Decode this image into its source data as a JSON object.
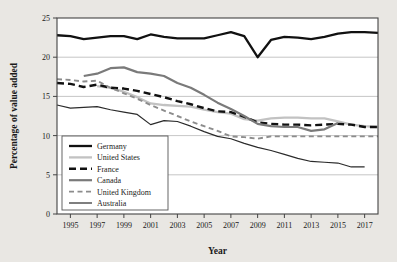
{
  "chart_data": {
    "type": "line",
    "title": "",
    "xlabel": "Year",
    "ylabel": "Percentage of value added",
    "xlim": [
      1994,
      2018
    ],
    "ylim": [
      0,
      25
    ],
    "grid": "horizontal",
    "legend_position": "lower-left-inside",
    "xticks": [
      1995,
      1997,
      1999,
      2001,
      2003,
      2005,
      2007,
      2009,
      2011,
      2013,
      2015,
      2017
    ],
    "xtick_labels": [
      "1995",
      "1997",
      "1999",
      "2001",
      "2003",
      "2005",
      "2007",
      "2009",
      "2011",
      "2013",
      "2015",
      "2017"
    ],
    "yticks": [
      0,
      5,
      10,
      15,
      20,
      25
    ],
    "ytick_labels": [
      "0",
      "5",
      "10",
      "15",
      "20",
      "25"
    ],
    "series": [
      {
        "name": "Germany",
        "color": "#111111",
        "width": 2.3,
        "dash": "none",
        "x": [
          1994,
          1995,
          1996,
          1997,
          1998,
          1999,
          2000,
          2001,
          2002,
          2003,
          2004,
          2005,
          2006,
          2007,
          2008,
          2009,
          2010,
          2011,
          2012,
          2013,
          2014,
          2015,
          2016,
          2017,
          2018
        ],
        "values": [
          22.8,
          22.7,
          22.3,
          22.5,
          22.7,
          22.7,
          22.3,
          22.9,
          22.6,
          22.4,
          22.4,
          22.4,
          22.8,
          23.2,
          22.7,
          20.0,
          22.2,
          22.6,
          22.5,
          22.3,
          22.6,
          23.0,
          23.2,
          23.2,
          23.1
        ]
      },
      {
        "name": "United States",
        "color": "#c2c2c2",
        "width": 2.3,
        "dash": "none",
        "x": [
          1997,
          1998,
          1999,
          2000,
          2001,
          2002,
          2003,
          2004,
          2005,
          2006,
          2007,
          2008,
          2009,
          2010,
          2011,
          2012,
          2013,
          2014,
          2015,
          2016,
          2017,
          2018
        ],
        "values": [
          16.3,
          16.1,
          15.6,
          14.9,
          14.1,
          13.9,
          13.8,
          13.7,
          13.3,
          13.0,
          12.8,
          12.1,
          11.9,
          12.2,
          12.3,
          12.3,
          12.2,
          12.2,
          11.8,
          11.4,
          11.2,
          11.1
        ]
      },
      {
        "name": "France",
        "color": "#111111",
        "width": 2.4,
        "dash": "7,4",
        "x": [
          1994,
          1995,
          1996,
          1997,
          1998,
          1999,
          2000,
          2001,
          2002,
          2003,
          2004,
          2005,
          2006,
          2007,
          2008,
          2009,
          2010,
          2011,
          2012,
          2013,
          2014,
          2015,
          2016,
          2017,
          2018
        ],
        "values": [
          16.7,
          16.6,
          16.2,
          16.5,
          16.1,
          16.0,
          15.7,
          15.3,
          14.9,
          14.4,
          14.0,
          13.5,
          13.1,
          13.0,
          12.4,
          11.7,
          11.5,
          11.4,
          11.4,
          11.3,
          11.4,
          11.5,
          11.4,
          11.1,
          11.1
        ]
      },
      {
        "name": "Canada",
        "color": "#7a7a7a",
        "width": 2.2,
        "dash": "none",
        "x": [
          1996,
          1997,
          1998,
          1999,
          2000,
          2001,
          2002,
          2003,
          2004,
          2005,
          2006,
          2007,
          2008,
          2009,
          2010,
          2011,
          2012,
          2013,
          2014,
          2015
        ],
        "values": [
          17.6,
          17.9,
          18.6,
          18.7,
          18.1,
          17.9,
          17.6,
          16.7,
          16.1,
          15.2,
          14.2,
          13.4,
          12.5,
          11.5,
          11.2,
          11.1,
          11.1,
          10.6,
          10.8,
          11.6
        ]
      },
      {
        "name": "United Kingdom",
        "color": "#8c8c8c",
        "width": 1.9,
        "dash": "5,3.5",
        "x": [
          1994,
          1995,
          1996,
          1997,
          1998,
          1999,
          2000,
          2001,
          2002,
          2003,
          2004,
          2005,
          2006,
          2007,
          2008,
          2009,
          2010,
          2011,
          2012,
          2013,
          2014,
          2015,
          2016,
          2017,
          2018
        ],
        "values": [
          17.2,
          17.1,
          16.9,
          17.0,
          16.1,
          15.4,
          14.7,
          13.9,
          13.2,
          12.5,
          11.8,
          11.2,
          10.6,
          9.9,
          9.8,
          9.6,
          9.9,
          9.9,
          9.9,
          9.9,
          9.9,
          9.9,
          9.9,
          9.9,
          9.9
        ]
      },
      {
        "name": "Australia",
        "color": "#2b2b2b",
        "width": 1.2,
        "dash": "none",
        "x": [
          1994,
          1995,
          1996,
          1997,
          1998,
          1999,
          2000,
          2001,
          2002,
          2003,
          2004,
          2005,
          2006,
          2007,
          2008,
          2009,
          2010,
          2011,
          2012,
          2013,
          2014,
          2015,
          2016,
          2017
        ],
        "values": [
          13.9,
          13.5,
          13.6,
          13.7,
          13.3,
          13.0,
          12.7,
          11.4,
          11.9,
          11.8,
          11.2,
          10.5,
          9.9,
          9.6,
          9.0,
          8.5,
          8.1,
          7.6,
          7.1,
          6.7,
          6.6,
          6.5,
          6.0,
          6.0
        ]
      }
    ]
  },
  "legend": {
    "entries": [
      {
        "label": "Germany"
      },
      {
        "label": "United States"
      },
      {
        "label": "France"
      },
      {
        "label": "Canada"
      },
      {
        "label": "United Kingdom"
      },
      {
        "label": "Australia"
      }
    ]
  },
  "colors": {
    "background": "#e9e7e3",
    "plot_background": "#ffffff",
    "axis": "#444444",
    "gridline": "#b8b8b8",
    "text": "#1a1a1a"
  }
}
